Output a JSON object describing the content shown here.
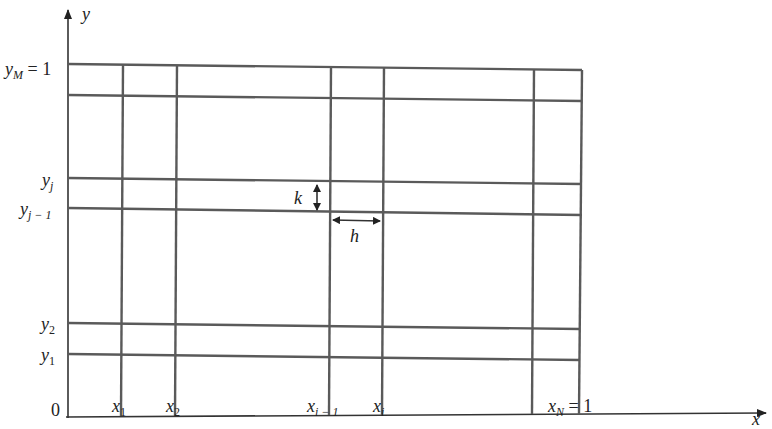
{
  "diagram": {
    "type": "finite-difference-grid",
    "axes": {
      "x_label": "x",
      "y_label": "y",
      "origin_label": "0"
    },
    "x_ticks": [
      {
        "base": "x",
        "sub": "1",
        "suffix": ""
      },
      {
        "base": "x",
        "sub": "2",
        "suffix": ""
      },
      {
        "base": "x",
        "sub": "i − 1",
        "suffix": ""
      },
      {
        "base": "x",
        "sub": "i",
        "suffix": ""
      },
      {
        "base": "x",
        "sub": "N",
        "suffix": " = 1"
      }
    ],
    "y_ticks": [
      {
        "base": "y",
        "sub": "1",
        "suffix": ""
      },
      {
        "base": "y",
        "sub": "2",
        "suffix": ""
      },
      {
        "base": "y",
        "sub": "j − 1",
        "suffix": ""
      },
      {
        "base": "y",
        "sub": "j",
        "suffix": ""
      },
      {
        "base": "y",
        "sub": "M",
        "suffix": " = 1"
      }
    ],
    "step_labels": {
      "vertical_step": "k",
      "horizontal_step": "h"
    },
    "colors": {
      "grid": "#5a5a5a",
      "axis": "#333333",
      "text": "#222222"
    }
  }
}
